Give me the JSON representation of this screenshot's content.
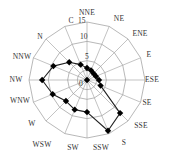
{
  "chart_data": {
    "type": "radar",
    "title": "",
    "subtitle": "",
    "directions": [
      "NNE",
      "NE",
      "ENE",
      "E",
      "ESE",
      "SE",
      "SSE",
      "S",
      "SSW",
      "SW",
      "WSW",
      "W",
      "WNW",
      "NW",
      "NNW",
      "N"
    ],
    "calm_label": "C",
    "radial_ticks": [
      "0",
      "5",
      "10",
      "15"
    ],
    "rlim": [
      0,
      15
    ],
    "grid": true,
    "legend": null,
    "series": [
      {
        "name": "wind frequency",
        "marker": "diamond",
        "values": [
          3.1,
          2.7,
          2.4,
          2.5,
          3.1,
          3.8,
          12.1,
          14.2,
          8.3,
          8.3,
          7.7,
          9.6,
          11.6,
          9.4,
          6.5,
          4.3
        ]
      }
    ],
    "calm_value": 0
  },
  "layout": {
    "center": [
      87,
      80
    ],
    "outer_radius_px": 58,
    "label_positions": {
      "NNE": [
        87,
        15
      ],
      "NE": [
        119,
        21
      ],
      "ENE": [
        140,
        36
      ],
      "E": [
        149,
        57
      ],
      "ESE": [
        152,
        82
      ],
      "SE": [
        147,
        105
      ],
      "SSE": [
        141,
        128
      ],
      "S": [
        124,
        145
      ],
      "SSW": [
        101,
        150
      ],
      "SW": [
        73,
        150
      ],
      "WSW": [
        42,
        147
      ],
      "W": [
        32,
        126
      ],
      "WNW": [
        20,
        103
      ],
      "NW": [
        16,
        82
      ],
      "NNW": [
        22,
        59
      ],
      "N": [
        40,
        39
      ],
      "C": [
        71,
        23
      ]
    },
    "tick_positions": {
      "0": [
        79,
        86
      ],
      "5": [
        85,
        59
      ],
      "10": [
        80,
        39
      ],
      "15": [
        78,
        23
      ]
    }
  }
}
